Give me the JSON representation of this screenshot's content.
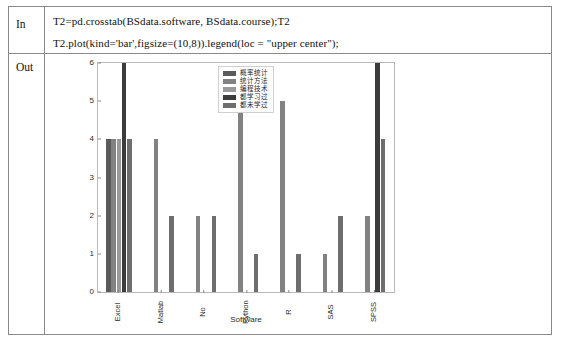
{
  "notebook": {
    "in_label": "In",
    "out_label": "Out",
    "code_lines": [
      "T2=pd.crosstab(BSdata.software, BSdata.course);T2",
      "T2.plot(kind='bar',figsize=(10,8)).legend(loc = \"upper center\");"
    ]
  },
  "chart_data": {
    "type": "bar",
    "title": "",
    "xlabel": "Software",
    "ylabel": "",
    "ylim": [
      0,
      6
    ],
    "yticks": [
      0,
      1,
      2,
      3,
      4,
      5,
      6
    ],
    "grid": false,
    "legend_position": "upper center",
    "categories": [
      "Excel",
      "Matlab",
      "No",
      "Python",
      "R",
      "SAS",
      "SPSS"
    ],
    "series": [
      {
        "name": "概率统计",
        "color": "#5a5a5a",
        "values": [
          4,
          0,
          0,
          0,
          0,
          0,
          0
        ]
      },
      {
        "name": "统计方法",
        "color": "#828282",
        "values": [
          4,
          4,
          2,
          5,
          5,
          1,
          2
        ]
      },
      {
        "name": "编程技术",
        "color": "#9a9a9a",
        "values": [
          4,
          0,
          0,
          0,
          0,
          0,
          0
        ]
      },
      {
        "name": "都学习过",
        "color": "#3c3c3c",
        "values": [
          6,
          0,
          0,
          0,
          0,
          0,
          6
        ]
      },
      {
        "name": "都未学过",
        "color": "#6e6e6e",
        "values": [
          4,
          2,
          2,
          1,
          1,
          2,
          4
        ]
      }
    ]
  }
}
